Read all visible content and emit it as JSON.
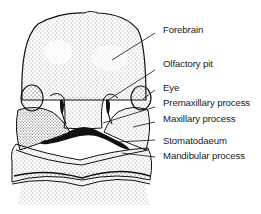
{
  "diagram": {
    "labels": [
      {
        "id": "forebrain",
        "text": "Forebrain",
        "y": 24
      },
      {
        "id": "olfactory-pit",
        "text": "Olfactory pit",
        "y": 58
      },
      {
        "id": "eye",
        "text": "Eye",
        "y": 82
      },
      {
        "id": "premaxillary-process",
        "text": "Premaxillary process",
        "y": 97
      },
      {
        "id": "maxillary-process",
        "text": "Maxillary process",
        "y": 113
      },
      {
        "id": "stomatodaeum",
        "text": "Stomatodaeum",
        "y": 135
      },
      {
        "id": "mandibular-process",
        "text": "Mandibular process",
        "y": 150
      }
    ],
    "colors": {
      "ink": "#111111",
      "background": "#ffffff"
    }
  }
}
